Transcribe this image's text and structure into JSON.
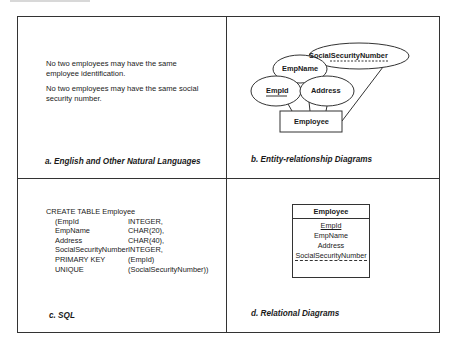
{
  "panels": {
    "a": {
      "caption": "a. English and Other Natural Languages",
      "paragraphs": [
        [
          "No two employees may have the same",
          "employee identification."
        ],
        [
          "No two employees may have the same social",
          "security number."
        ]
      ]
    },
    "b": {
      "caption": "b. Entity-relationship Diagrams",
      "entity": "Employee",
      "attributes": {
        "empid": "EmpId",
        "empname": "EmpName",
        "address": "Address",
        "ssn": "SocialSecurityNumber"
      }
    },
    "c": {
      "caption": "c. SQL",
      "header": "CREATE TABLE Employee",
      "rows": [
        {
          "col1": "(EmpId",
          "col2": "INTEGER,"
        },
        {
          "col1": "EmpName",
          "col2": "CHAR(20),"
        },
        {
          "col1": "Address",
          "col2": "CHAR(40),"
        },
        {
          "col1": "SocialSecurityNumber",
          "col2": "INTEGER,"
        },
        {
          "col1": "PRIMARY KEY",
          "col2": "(EmpId)"
        },
        {
          "col1": "UNIQUE",
          "col2": "(SocialSecurityNumber))"
        }
      ]
    },
    "d": {
      "caption": "d. Relational Diagrams",
      "table_name": "Employee",
      "fields": [
        "EmpId",
        "EmpName",
        "Address",
        "SocialSecurityNumber"
      ]
    }
  }
}
